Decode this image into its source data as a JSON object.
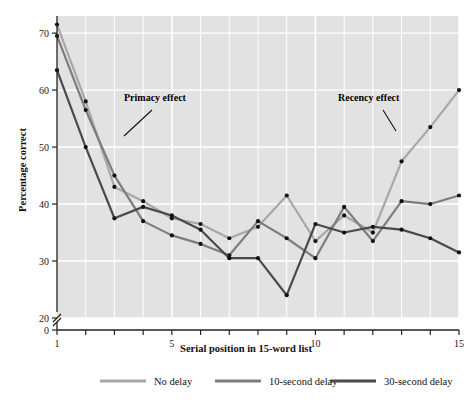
{
  "chart_data": {
    "type": "line",
    "title": "",
    "xlabel": "Serial position in 15-word list",
    "ylabel": "Percentage correct",
    "x": [
      1,
      2,
      3,
      4,
      5,
      6,
      7,
      8,
      9,
      10,
      11,
      12,
      13,
      14,
      15
    ],
    "xtick_labels": [
      "1",
      "5",
      "10",
      "15"
    ],
    "xtick_values": [
      1,
      5,
      10,
      15
    ],
    "ytick_labels": [
      "0",
      "20",
      "30",
      "40",
      "50",
      "60",
      "70"
    ],
    "ytick_values": [
      0,
      20,
      30,
      40,
      50,
      60,
      70
    ],
    "ylim": [
      20,
      73
    ],
    "xlim": [
      1,
      15
    ],
    "y_axis_break": true,
    "y_axis_break_between": [
      0,
      20
    ],
    "grid": true,
    "grid_color": "#ffffff",
    "plot_background": "#e2e2e2",
    "legend_position": "below",
    "series": [
      {
        "name": "No delay",
        "color": "#a8a8a8",
        "values": [
          71.5,
          58.0,
          43.0,
          40.5,
          37.5,
          36.5,
          34.0,
          36.0,
          41.5,
          33.5,
          38.0,
          35.0,
          47.5,
          53.5,
          60.0
        ]
      },
      {
        "name": "10-second delay",
        "color": "#7d7d7d",
        "values": [
          69.5,
          56.5,
          45.0,
          37.0,
          34.5,
          33.0,
          31.0,
          37.0,
          34.0,
          30.5,
          39.5,
          33.5,
          40.5,
          40.0,
          41.5
        ]
      },
      {
        "name": "30-second delay",
        "color": "#4a4a4a",
        "values": [
          63.5,
          50.0,
          37.5,
          39.5,
          38.0,
          35.5,
          30.5,
          30.5,
          24.0,
          36.5,
          35.0,
          36.0,
          35.5,
          34.0,
          31.5
        ]
      }
    ],
    "annotations": [
      {
        "text": "Primacy effect",
        "x": 3,
        "y": 56
      },
      {
        "text": "Recency effect",
        "x": 12.6,
        "y": 56
      }
    ]
  },
  "legend": {
    "items": [
      {
        "label": "No delay",
        "color": "#a8a8a8"
      },
      {
        "label": "10-second delay",
        "color": "#7d7d7d"
      },
      {
        "label": "30-second delay",
        "color": "#4a4a4a"
      }
    ]
  }
}
